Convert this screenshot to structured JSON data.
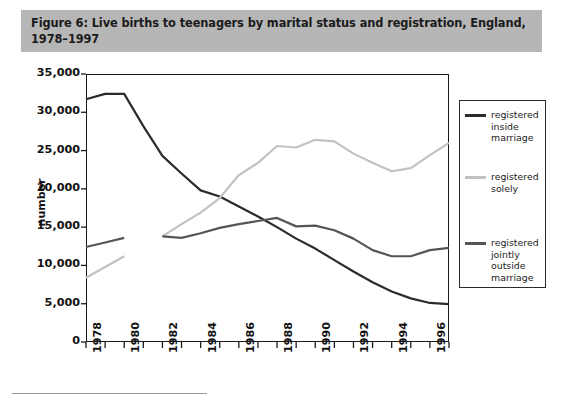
{
  "figure": {
    "title": "Figure 6:  Live births to teenagers by marital status and registration, England,\n1978–1997",
    "title_bg": "#b6b6b6"
  },
  "axes": {
    "y_axis_label": "number",
    "y_ticks": [
      "0",
      "5,000",
      "10,000",
      "15,000",
      "20,000",
      "25,000",
      "30,000",
      "35,000"
    ],
    "x_ticks": [
      "1978",
      "1980",
      "1982",
      "1984",
      "1986",
      "1988",
      "1990",
      "1992",
      "1994",
      "1996"
    ]
  },
  "legend": {
    "items": [
      {
        "label": "registered\ninside\nmarriage",
        "color": "#2b2b2b"
      },
      {
        "label": "registered\nsolely",
        "color": "#c2c2c2"
      },
      {
        "label": "registered\njointly\noutside\nmarriage",
        "color": "#555555"
      }
    ]
  },
  "chart_data": {
    "type": "line",
    "title": "Figure 6:  Live births to teenagers by marital status and registration, England, 1978–1997",
    "xlabel": "",
    "ylabel": "number",
    "xlim": [
      1978,
      1997
    ],
    "ylim": [
      0,
      35000
    ],
    "ytick_values": [
      0,
      5000,
      10000,
      15000,
      20000,
      25000,
      30000,
      35000
    ],
    "xtick_values": [
      1978,
      1979,
      1980,
      1981,
      1982,
      1983,
      1984,
      1985,
      1986,
      1987,
      1988,
      1989,
      1990,
      1991,
      1992,
      1993,
      1994,
      1995,
      1996,
      1997
    ],
    "xtick_labelled": [
      1978,
      1980,
      1982,
      1984,
      1986,
      1988,
      1990,
      1992,
      1994,
      1996
    ],
    "grid": false,
    "legend_position": "right-outside",
    "note": "Series 'registered solely' and 'registered jointly outside marriage' have a data break between 1980 and 1982.",
    "series": [
      {
        "name": "registered inside marriage",
        "color": "#2b2b2b",
        "x": [
          1978,
          1979,
          1980,
          1981,
          1982,
          1983,
          1984,
          1985,
          1986,
          1987,
          1988,
          1989,
          1990,
          1991,
          1992,
          1993,
          1994,
          1995,
          1996,
          1997
        ],
        "values": [
          31700,
          32400,
          32400,
          28200,
          24300,
          22000,
          19800,
          19000,
          17700,
          16400,
          15000,
          13500,
          12200,
          10700,
          9200,
          7800,
          6600,
          5700,
          5100,
          4950
        ]
      },
      {
        "name": "registered solely",
        "color": "#c2c2c2",
        "x": [
          1978,
          1979,
          1980,
          1982,
          1983,
          1984,
          1985,
          1986,
          1987,
          1988,
          1989,
          1990,
          1991,
          1992,
          1993,
          1994,
          1995,
          1996,
          1997
        ],
        "values": [
          8400,
          9800,
          11200,
          13800,
          15400,
          16900,
          18800,
          21800,
          23400,
          25600,
          25400,
          26400,
          26200,
          24600,
          23400,
          22300,
          22700,
          24400,
          26000
        ]
      },
      {
        "name": "registered jointly outside marriage",
        "color": "#555555",
        "x": [
          1978,
          1979,
          1980,
          1982,
          1983,
          1984,
          1985,
          1986,
          1987,
          1988,
          1989,
          1990,
          1991,
          1992,
          1993,
          1994,
          1995,
          1996,
          1997
        ],
        "values": [
          12400,
          13000,
          13600,
          13800,
          13600,
          14200,
          14900,
          15400,
          15800,
          16200,
          15100,
          15200,
          14600,
          13500,
          12000,
          11200,
          11200,
          12000,
          12300
        ]
      }
    ]
  }
}
